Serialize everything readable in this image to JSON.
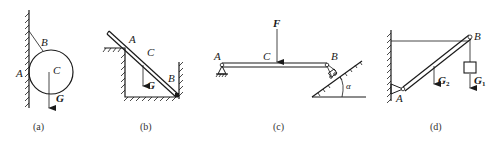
{
  "figures": [
    {
      "id": "a",
      "caption": "(a)",
      "labels": {
        "A": "A",
        "B": "B",
        "C": "C",
        "G": "G"
      },
      "description": "Sphere hanging by a rope from a vertical wall, touching the wall at A"
    },
    {
      "id": "b",
      "caption": "(b)",
      "labels": {
        "A": "A",
        "B": "B",
        "C": "C",
        "G": "G"
      },
      "description": "Rod resting on a corner edge at A and in a pit corner at B"
    },
    {
      "id": "c",
      "caption": "(c)",
      "labels": {
        "A": "A",
        "B": "B",
        "C": "C",
        "F": "F",
        "alpha": "α"
      },
      "description": "Beam with pin support at A and roller on an incline at B, load F at C"
    },
    {
      "id": "d",
      "caption": "(d)",
      "labels": {
        "A": "A",
        "B": "B",
        "G1": "G",
        "G1_sub": "1",
        "G2": "G",
        "G2_sub": "2"
      },
      "description": "Rod hinged at wall A, held by horizontal rope, weight hanging from B"
    }
  ],
  "colors": {
    "ink": "#1a1a1a",
    "background": "#ffffff"
  }
}
